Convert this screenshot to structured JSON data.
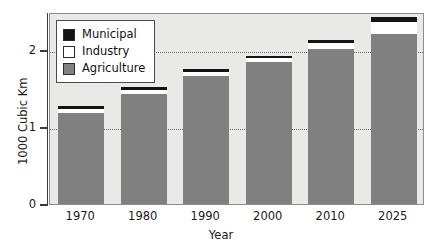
{
  "chart_data": {
    "type": "bar",
    "subtype": "stacked-vertical",
    "title": "",
    "xlabel": "Year",
    "ylabel": "1000 Cubic Km",
    "categories": [
      "1970",
      "1980",
      "1990",
      "2000",
      "2010",
      "2025"
    ],
    "ylim": [
      0,
      2.5
    ],
    "yticks": [
      0,
      1,
      2
    ],
    "ytick_labels": [
      "0",
      "1",
      "2"
    ],
    "grid": "horizontal-dotted",
    "legend_position": "top-left-inside",
    "series": [
      {
        "name": "Agriculture",
        "color": "#808080",
        "values": [
          1.18,
          1.43,
          1.66,
          1.85,
          2.01,
          2.21
        ]
      },
      {
        "name": "Industry",
        "color": "#ffffff",
        "values": [
          0.05,
          0.05,
          0.05,
          0.05,
          0.08,
          0.16
        ]
      },
      {
        "name": "Municipal",
        "color": "#141414",
        "values": [
          0.04,
          0.04,
          0.04,
          0.02,
          0.04,
          0.06
        ]
      }
    ],
    "totals": [
      1.27,
      1.52,
      1.75,
      1.92,
      2.13,
      2.43
    ]
  },
  "legend": {
    "items": [
      {
        "label": "Municipal",
        "swatch": "#141414"
      },
      {
        "label": "Industry",
        "swatch": "#ffffff"
      },
      {
        "label": "Agriculture",
        "swatch": "#808080"
      }
    ]
  },
  "colors": {
    "plot_background": "#e9e9e7",
    "axis": "#3a3a3a",
    "grid": "#6e6e6e",
    "frame": "#8d8d8d"
  }
}
